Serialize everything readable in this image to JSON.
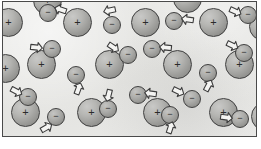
{
  "figure": {
    "background_color": "#e8e8e6",
    "border_color": "#4a4a4a",
    "positive_sign": "+",
    "negative_sign": "−",
    "legend": {
      "positive_label": "positive ion (fixed lattice)",
      "negative_label": "free electron (mobile)",
      "arrow_label": "velocity direction"
    },
    "counts": {
      "positive_ions": 17,
      "electrons": 17,
      "arrows": 17
    },
    "ion_diameter_px": 29,
    "electron_diameter_px": 18,
    "positive_ions": [
      {
        "name": "ion-r1-c1",
        "x": -9,
        "y": 6
      },
      {
        "name": "ion-r1-c2",
        "x": 60,
        "y": 6
      },
      {
        "name": "ion-r1-c3",
        "x": 128,
        "y": 6
      },
      {
        "name": "ion-r1-c4",
        "x": 196,
        "y": 6
      },
      {
        "name": "ion-r1-c5",
        "x": 246,
        "y": 10
      },
      {
        "name": "ion-r2-c1",
        "x": 24,
        "y": 48
      },
      {
        "name": "ion-r2-c2",
        "x": 92,
        "y": 48
      },
      {
        "name": "ion-r2-c3",
        "x": 160,
        "y": 48
      },
      {
        "name": "ion-r2-c4",
        "x": 222,
        "y": 48
      },
      {
        "name": "ion-r2-c0",
        "x": -12,
        "y": 52
      },
      {
        "name": "ion-r3-c1",
        "x": 8,
        "y": 96
      },
      {
        "name": "ion-r3-c2",
        "x": 74,
        "y": 96
      },
      {
        "name": "ion-r3-c3",
        "x": 140,
        "y": 96
      },
      {
        "name": "ion-r3-c4",
        "x": 206,
        "y": 96
      },
      {
        "name": "ion-r3-c5",
        "x": 248,
        "y": 100
      },
      {
        "name": "ion-r0-c1",
        "x": 30,
        "y": -16
      },
      {
        "name": "ion-r0-c2",
        "x": 170,
        "y": -18
      }
    ],
    "electrons": [
      {
        "name": "electron-1",
        "x": 36,
        "y": 2,
        "arrow": {
          "x": 50,
          "y": 0,
          "rotate": 18
        }
      },
      {
        "name": "electron-2",
        "x": 100,
        "y": 14,
        "arrow": {
          "x": 99,
          "y": 1,
          "rotate": -12
        }
      },
      {
        "name": "electron-3",
        "x": 162,
        "y": 10,
        "arrow": {
          "x": 177,
          "y": 10,
          "rotate": 8
        }
      },
      {
        "name": "electron-4",
        "x": 236,
        "y": 4,
        "arrow": {
          "x": 225,
          "y": 2,
          "rotate": 204
        }
      },
      {
        "name": "electron-5",
        "x": 40,
        "y": 38,
        "arrow": {
          "x": 26,
          "y": 38,
          "rotate": 186
        }
      },
      {
        "name": "electron-6",
        "x": 116,
        "y": 44,
        "arrow": {
          "x": 103,
          "y": 38,
          "rotate": 214
        }
      },
      {
        "name": "electron-7",
        "x": 140,
        "y": 38,
        "arrow": {
          "x": 155,
          "y": 38,
          "rotate": 6
        }
      },
      {
        "name": "electron-8",
        "x": 232,
        "y": 42,
        "arrow": {
          "x": 222,
          "y": 36,
          "rotate": 206
        }
      },
      {
        "name": "electron-9",
        "x": 64,
        "y": 64,
        "arrow": {
          "x": 68,
          "y": 79,
          "rotate": 110
        }
      },
      {
        "name": "electron-10",
        "x": 196,
        "y": 62,
        "arrow": {
          "x": 198,
          "y": 76,
          "rotate": 118
        }
      },
      {
        "name": "electron-11",
        "x": 126,
        "y": 84,
        "arrow": {
          "x": 140,
          "y": 84,
          "rotate": 8
        }
      },
      {
        "name": "electron-12",
        "x": 16,
        "y": 86,
        "arrow": {
          "x": 6,
          "y": 82,
          "rotate": 208
        }
      },
      {
        "name": "electron-13",
        "x": 180,
        "y": 88,
        "arrow": {
          "x": 168,
          "y": 82,
          "rotate": 206
        }
      },
      {
        "name": "electron-14",
        "x": 96,
        "y": 98,
        "arrow": {
          "x": 98,
          "y": 86,
          "rotate": -76
        }
      },
      {
        "name": "electron-15",
        "x": 44,
        "y": 106,
        "arrow": {
          "x": 36,
          "y": 118,
          "rotate": 150
        }
      },
      {
        "name": "electron-16",
        "x": 158,
        "y": 104,
        "arrow": {
          "x": 160,
          "y": 118,
          "rotate": 108
        }
      },
      {
        "name": "electron-17",
        "x": 228,
        "y": 108,
        "arrow": {
          "x": 216,
          "y": 108,
          "rotate": 188
        }
      }
    ]
  }
}
